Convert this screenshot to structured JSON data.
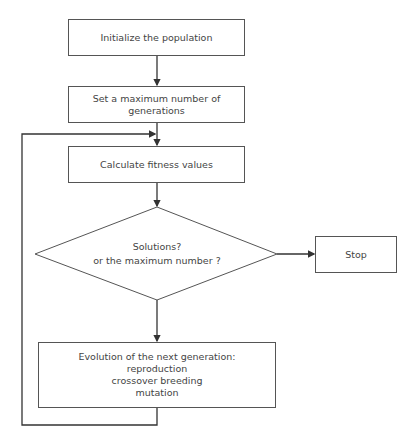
{
  "flowchart": {
    "nodes": {
      "init": {
        "label": "Initialize the population"
      },
      "max_gen": {
        "line1": "Set a maximum number of",
        "line2": "generations"
      },
      "fitness": {
        "label": "Calculate fitness values"
      },
      "decision": {
        "line1": "Solutions?",
        "line2": "or the maximum number ?"
      },
      "stop": {
        "label": "Stop"
      },
      "evolution": {
        "title": "Evolution of the next generation:",
        "steps": [
          "reproduction",
          "crossover breeding",
          "mutation"
        ]
      }
    },
    "colors": {
      "stroke": "#444444",
      "background": "#ffffff",
      "text": "#444444"
    }
  }
}
